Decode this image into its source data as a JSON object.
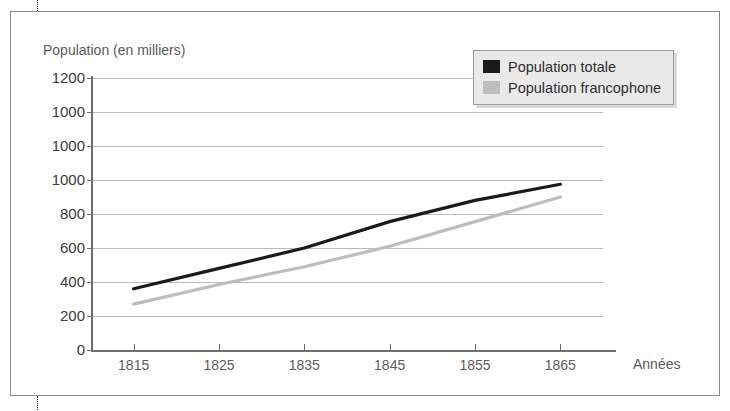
{
  "figure": {
    "frame_label": "scan-frame",
    "crop_marks": [
      "top",
      "bottom"
    ]
  },
  "chart_data": {
    "type": "line",
    "title": "Population (en milliers)",
    "xlabel": "Années",
    "ylabel": "Population (en milliers)",
    "x": [
      1815,
      1825,
      1835,
      1845,
      1855,
      1865
    ],
    "xtick_labels": [
      "1815",
      "1825",
      "1835",
      "1845",
      "1855",
      "1865"
    ],
    "ytick_labels": [
      "1200",
      "1000",
      "1000",
      "1000",
      "800",
      "600",
      "400",
      "200",
      "0"
    ],
    "ytick_values": [
      1600,
      1400,
      1200,
      1000,
      800,
      600,
      400,
      200,
      0
    ],
    "ylim": [
      0,
      1600
    ],
    "xlim": [
      1810,
      1870
    ],
    "grid": true,
    "legend_position": "top-right",
    "series": [
      {
        "name": "Population totale",
        "color": "#1a1a1a",
        "values": [
          360,
          480,
          600,
          755,
          880,
          975
        ]
      },
      {
        "name": "Population francophone",
        "color": "#bdbdbd",
        "values": [
          270,
          385,
          490,
          610,
          755,
          900
        ]
      }
    ]
  },
  "legend": {
    "items": [
      {
        "label": "Population totale",
        "color": "#1a1a1a"
      },
      {
        "label": "Population francophone",
        "color": "#bdbdbd"
      }
    ]
  },
  "colors": {
    "axis": "#6d6d6d",
    "grid": "#b9b9b9",
    "frame": "#8a8a8a",
    "legend_background": "#e9e9e9",
    "text": "#4a4a4a"
  }
}
